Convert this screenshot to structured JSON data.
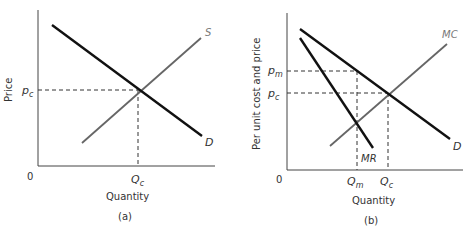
{
  "panels": {
    "a": {
      "caption": "(a)",
      "ylabel": "Price",
      "xlabel": "Quantity",
      "origin": "0",
      "p_c": {
        "base": "p",
        "sub": "c"
      },
      "Q_c": {
        "base": "Q",
        "sub": "c"
      },
      "supply_label": "S",
      "demand_label": "D"
    },
    "b": {
      "caption": "(b)",
      "ylabel": "Per unit cost and price",
      "xlabel": "Quantity",
      "origin": "0",
      "p_m": {
        "base": "p",
        "sub": "m"
      },
      "p_c": {
        "base": "p",
        "sub": "c"
      },
      "Q_m": {
        "base": "Q",
        "sub": "m"
      },
      "Q_c": {
        "base": "Q",
        "sub": "c"
      },
      "mc_label": "MC",
      "mr_label": "MR",
      "demand_label": "D"
    }
  },
  "colors": {
    "demand": "#111111",
    "mr": "#111111",
    "supply_mc": "#666666",
    "axis": "#444444"
  }
}
